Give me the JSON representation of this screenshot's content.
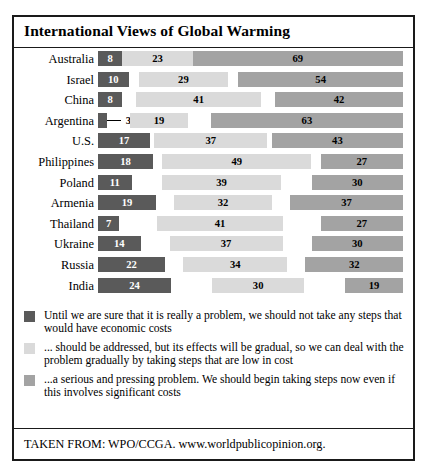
{
  "figure": {
    "title": "International Views of Global Warming",
    "source": "TAKEN FROM: WPO/CCGA. www.worldpublicopinion.org."
  },
  "colors": {
    "series_0": "#5a5a5a",
    "series_1": "#dadada",
    "series_2": "#a3a3a3",
    "border": "#1a1a1a",
    "background": "#ffffff"
  },
  "legend": {
    "items": [
      {
        "swatch": "series_0",
        "text": "Until we are sure that it is really a problem, we should not take any steps that would have economic costs"
      },
      {
        "swatch": "series_1",
        "text": "... should be addressed, but its effects will be gradual, so we can deal with the problem gradually by taking steps that are low in cost"
      },
      {
        "swatch": "series_2",
        "text": "...a serious and pressing problem. We should begin taking steps now even if this involves significant costs"
      }
    ]
  },
  "chart_data": {
    "type": "bar",
    "orientation": "horizontal",
    "stacked": true,
    "title": "International Views of Global Warming",
    "xlabel": "",
    "ylabel": "",
    "xlim": [
      0,
      100
    ],
    "grid": false,
    "legend_position": "below",
    "units": "percent",
    "categories": [
      "Australia",
      "Israel",
      "China",
      "Argentina",
      "U.S.",
      "Philippines",
      "Poland",
      "Armenia",
      "Thailand",
      "Ukraine",
      "Russia",
      "India"
    ],
    "series": [
      {
        "name": "Until we are sure that it is really a problem, we should not take any steps that would have economic costs",
        "color": "#5a5a5a",
        "values": [
          8,
          10,
          8,
          3,
          17,
          18,
          11,
          19,
          7,
          14,
          22,
          24
        ]
      },
      {
        "name": "... should be addressed, but its effects will be gradual, so we can deal with the problem gradually by taking steps that are low in cost",
        "color": "#dadada",
        "values": [
          23,
          29,
          41,
          19,
          37,
          49,
          39,
          32,
          41,
          37,
          34,
          30
        ]
      },
      {
        "name": "...a serious and pressing problem. We should begin taking steps now even if this involves significant costs",
        "color": "#a3a3a3",
        "values": [
          69,
          54,
          42,
          63,
          43,
          27,
          30,
          37,
          27,
          30,
          32,
          19
        ]
      }
    ]
  }
}
